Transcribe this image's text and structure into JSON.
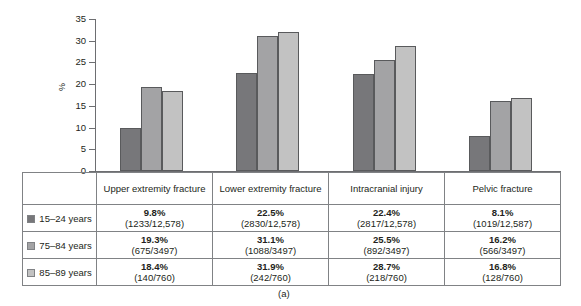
{
  "caption": "(a)",
  "colors": {
    "series_0": "#77777a",
    "series_1": "#a3a3a5",
    "series_2": "#c2c2c2",
    "axis": "#6d6e71",
    "table_border": "#808285",
    "text": "#231f20"
  },
  "chart_data": {
    "type": "bar",
    "title": "",
    "subtitle": "",
    "xlabel": "",
    "ylabel": "%",
    "ylim": [
      0,
      35
    ],
    "yticks": [
      0,
      5,
      10,
      15,
      20,
      25,
      30,
      35
    ],
    "grid": false,
    "legend_position": "table-left-column",
    "categories": [
      "Upper extremity fracture",
      "Lower extremity fracture",
      "Intracranial injury",
      "Pelvic fracture"
    ],
    "series": [
      {
        "name": "15–24 years",
        "color": "#77777a",
        "values": [
          9.8,
          22.5,
          22.4,
          8.1
        ],
        "counts": [
          "(1233/12,578)",
          "(2830/12,578)",
          "(2817/12,578)",
          "(1019/12,587)"
        ],
        "percent_labels": [
          "9.8%",
          "22.5%",
          "22.4%",
          "8.1%"
        ]
      },
      {
        "name": "75–84 years",
        "color": "#a3a3a5",
        "values": [
          19.3,
          31.1,
          25.5,
          16.2
        ],
        "counts": [
          "(675/3497)",
          "(1088/3497)",
          "(892/3497)",
          "(566/3497)"
        ],
        "percent_labels": [
          "19.3%",
          "31.1%",
          "25.5%",
          "16.2%"
        ]
      },
      {
        "name": "85–89 years",
        "color": "#c2c2c2",
        "values": [
          18.4,
          31.9,
          28.7,
          16.8
        ],
        "counts": [
          "(140/760)",
          "(242/760)",
          "(218/760)",
          "(128/760)"
        ],
        "percent_labels": [
          "18.4%",
          "31.9%",
          "28.7%",
          "16.8%"
        ]
      }
    ]
  }
}
